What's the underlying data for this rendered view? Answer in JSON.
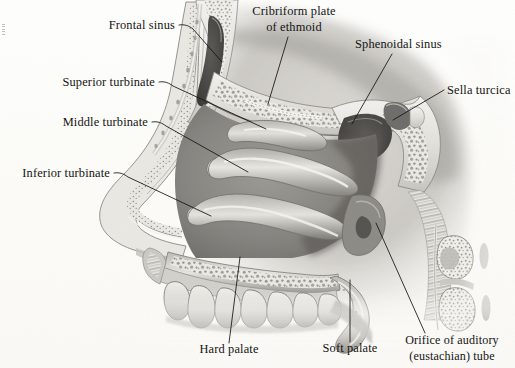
{
  "figure": {
    "medium": "grayscale anatomical illustration",
    "background_color": "#fdfdfb",
    "ink_color": "#141414"
  },
  "labels": [
    {
      "id": "frontal-sinus",
      "text": "Frontal sinus",
      "anchor": "end",
      "x": 175,
      "y": 29,
      "leader": "M179,25 C185,24 189,26 193,29 L222,62",
      "structure_note": "air cavity within the frontal bone above the nasal bridge"
    },
    {
      "id": "cribriform-plate",
      "line1": "Cribriform plate",
      "line2": "of ethmoid",
      "text": "Cribriform plate of ethmoid",
      "anchor": "middle",
      "x": 294,
      "y": 15,
      "x2": 294,
      "y2": 31,
      "leader": "M288,37 L268,104",
      "structure_note": "perforated bony roof of the nasal cavity"
    },
    {
      "id": "sphenoidal-sinus",
      "text": "Sphenoidal sinus",
      "anchor": "start",
      "x": 355,
      "y": 48,
      "leader": "M392,54 L352,124",
      "structure_note": "air cavity within the sphenoid bone"
    },
    {
      "id": "sella-turcica",
      "text": "Sella turcica",
      "anchor": "start",
      "x": 447,
      "y": 94,
      "leader": "M444,90 L393,120",
      "structure_note": "saddle-shaped depression housing the pituitary gland"
    },
    {
      "id": "superior-turbinate",
      "text": "Superior turbinate",
      "anchor": "end",
      "x": 155,
      "y": 86,
      "leader": "M159,82 C165,81 169,83 173,86 L266,129",
      "structure_note": "uppermost nasal concha"
    },
    {
      "id": "middle-turbinate",
      "text": "Middle turbinate",
      "anchor": "end",
      "x": 148,
      "y": 126,
      "leader": "M152,122 C158,121 162,123 166,126 L248,172",
      "structure_note": "middle nasal concha"
    },
    {
      "id": "inferior-turbinate",
      "text": "Inferior turbinate",
      "anchor": "end",
      "x": 110,
      "y": 177,
      "leader": "M114,173 C120,172 124,174 128,177 L211,216",
      "structure_note": "lowest and largest nasal concha"
    },
    {
      "id": "hard-palate",
      "text": "Hard palate",
      "anchor": "middle",
      "x": 229,
      "y": 353,
      "leader": "M229,343 L240,257",
      "structure_note": "bony anterior roof of the mouth"
    },
    {
      "id": "soft-palate",
      "text": "Soft palate",
      "anchor": "middle",
      "x": 350,
      "y": 352,
      "leader": "M350,342 L350,280",
      "structure_note": "muscular posterior roof of the mouth"
    },
    {
      "id": "orifice-auditory-tube",
      "line1": "Orifice of auditory",
      "line2": "(eustachian) tube",
      "text": "Orifice of auditory (eustachian) tube",
      "anchor": "middle",
      "x": 452,
      "y": 344,
      "x2": 452,
      "y2": 360,
      "leader": "M425,333 L376,223",
      "structure_note": "pharyngeal opening of the eustachian tube"
    }
  ]
}
